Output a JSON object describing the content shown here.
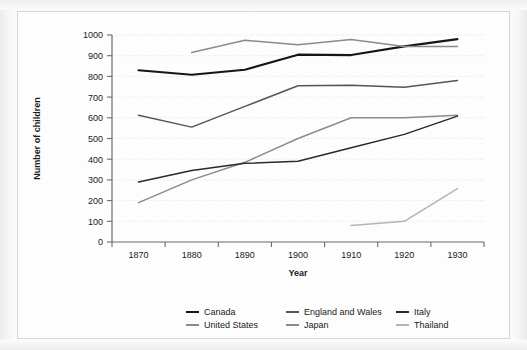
{
  "chart_data": {
    "type": "line",
    "title": "",
    "xlabel": "Year",
    "ylabel": "Number of children",
    "x": [
      1870,
      1880,
      1890,
      1900,
      1910,
      1920,
      1930
    ],
    "xlim": [
      1865,
      1935
    ],
    "ylim": [
      0,
      1000
    ],
    "xticklabels": [
      "1870",
      "1880",
      "1890",
      "1900",
      "1910",
      "1920",
      "1930"
    ],
    "yticklabels": [
      "0",
      "100",
      "200",
      "300",
      "400",
      "500",
      "600",
      "700",
      "800",
      "900",
      "1000"
    ],
    "ytick_values": [
      0,
      100,
      200,
      300,
      400,
      500,
      600,
      700,
      800,
      900,
      1000
    ],
    "grid": "horizontal-dotted",
    "legend_position": "bottom",
    "legend_columns": 3,
    "series": [
      {
        "name": "Canada",
        "color": "#161616",
        "x": [
          1870,
          1880,
          1890,
          1900,
          1910,
          1920,
          1930
        ],
        "values": [
          830,
          808,
          832,
          905,
          903,
          945,
          980
        ]
      },
      {
        "name": "United States",
        "color": "#8b8b8b",
        "x": [
          1880,
          1890,
          1900,
          1910,
          1920,
          1930
        ],
        "values": [
          915,
          975,
          953,
          978,
          945,
          945
        ]
      },
      {
        "name": "England and Wales",
        "color": "#565656",
        "x": [
          1870,
          1880,
          1890,
          1900,
          1910,
          1920,
          1930
        ],
        "values": [
          612,
          555,
          655,
          755,
          757,
          748,
          780
        ]
      },
      {
        "name": "Japan",
        "color": "#8b8b8b",
        "x": [
          1870,
          1880,
          1890,
          1900,
          1910,
          1920,
          1930
        ],
        "values": [
          190,
          300,
          385,
          500,
          600,
          600,
          612
        ]
      },
      {
        "name": "Italy",
        "color": "#2a2a2a",
        "x": [
          1870,
          1880,
          1890,
          1900,
          1910,
          1920,
          1930
        ],
        "values": [
          290,
          345,
          380,
          390,
          455,
          520,
          608
        ]
      },
      {
        "name": "Thailand",
        "color": "#b4b4b4",
        "x": [
          1910,
          1920,
          1930
        ],
        "values": [
          80,
          100,
          258
        ]
      }
    ]
  },
  "legend": {
    "items": [
      {
        "label": "Canada",
        "color": "#161616"
      },
      {
        "label": "England and Wales",
        "color": "#565656"
      },
      {
        "label": "Italy",
        "color": "#2a2a2a"
      },
      {
        "label": "United States",
        "color": "#8b8b8b"
      },
      {
        "label": "Japan",
        "color": "#8b8b8b"
      },
      {
        "label": "Thailand",
        "color": "#b4b4b4"
      }
    ]
  }
}
